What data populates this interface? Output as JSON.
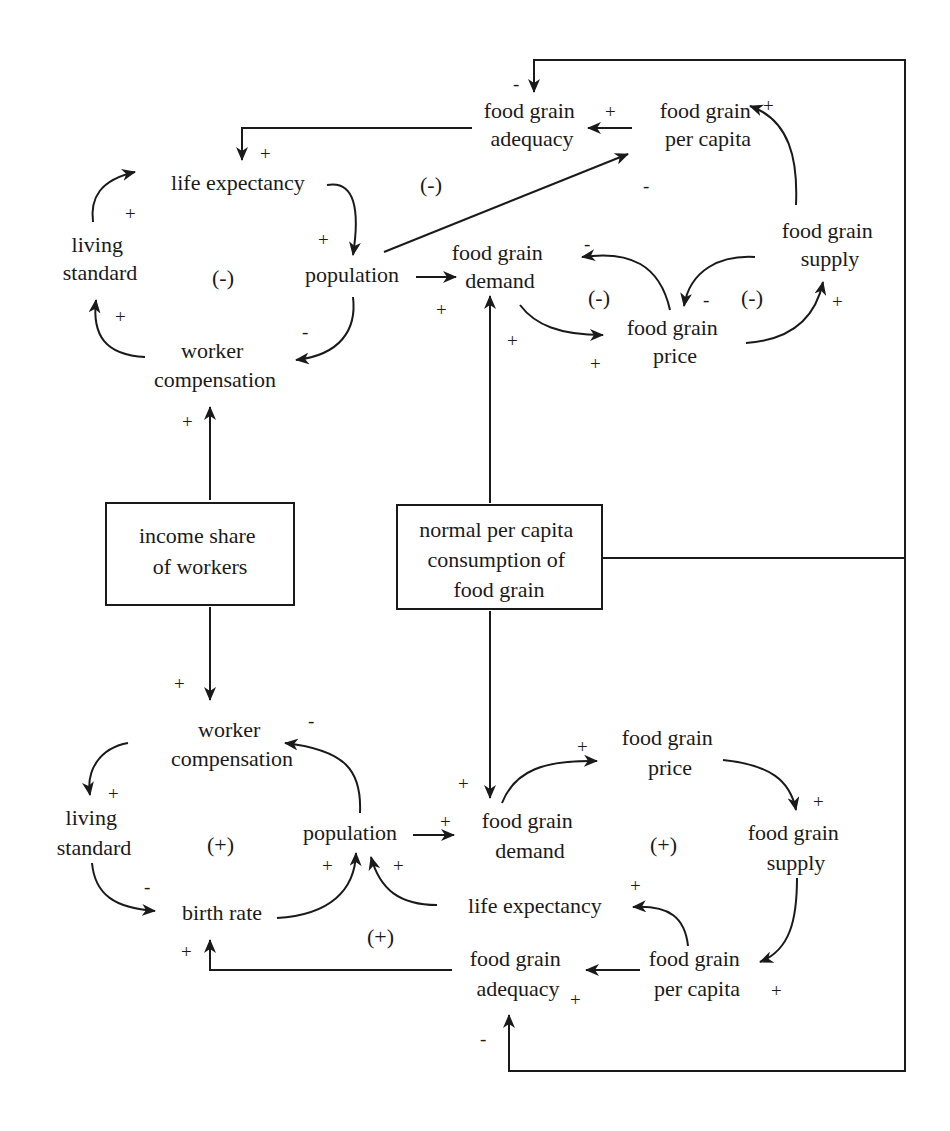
{
  "diagram": {
    "type": "causal-loop-diagram",
    "colors": {
      "ink": "#1a1a1a",
      "background": "#ffffff"
    },
    "boxes": {
      "income_share": {
        "lines": [
          "income share",
          "of workers"
        ]
      },
      "normal_consumption": {
        "lines": [
          "normal per capita",
          "consumption of",
          "food grain"
        ]
      }
    },
    "top": {
      "nodes": {
        "adequacy": [
          "food grain",
          "adequacy"
        ],
        "per_capita": [
          "food grain",
          "per capita"
        ],
        "life_expectancy": [
          "life expectancy"
        ],
        "living_standard": [
          "living",
          "standard"
        ],
        "population": [
          "population"
        ],
        "demand": [
          "food grain",
          "demand"
        ],
        "supply": [
          "food grain",
          "supply"
        ],
        "price": [
          "food grain",
          "price"
        ],
        "worker_comp": [
          "worker",
          "compensation"
        ]
      },
      "signs": [
        "-",
        "+",
        "+",
        "+",
        "+",
        "+",
        "-",
        "+",
        "+",
        "-",
        "+",
        "+",
        "-",
        "+",
        "+",
        "-",
        "+"
      ],
      "loops": [
        "(-)",
        "(-)",
        "(-)",
        "(-)"
      ]
    },
    "bottom": {
      "nodes": {
        "worker_comp": [
          "worker",
          "compensation"
        ],
        "living_standard": [
          "living",
          "standard"
        ],
        "population": [
          "population"
        ],
        "birth_rate": [
          "birth rate"
        ],
        "demand": [
          "food grain",
          "demand"
        ],
        "price": [
          "food grain",
          "price"
        ],
        "supply": [
          "food grain",
          "supply"
        ],
        "life_expectancy": [
          "life expectancy"
        ],
        "adequacy": [
          "food grain",
          "adequacy"
        ],
        "per_capita": [
          "food grain",
          "per capita"
        ]
      },
      "signs": [
        "+",
        "-",
        "+",
        "-",
        "+",
        "+",
        "+",
        "+",
        "+",
        "+",
        "+",
        "+",
        "+",
        "+",
        "+",
        "-"
      ],
      "loops": [
        "(+)",
        "(+)",
        "(+)"
      ]
    },
    "links": [
      {
        "from": "per capita (top)",
        "to": "adequacy (top)",
        "polarity": "+"
      },
      {
        "from": "supply (top)",
        "to": "per capita (top)",
        "polarity": "+"
      },
      {
        "from": "population (top)",
        "to": "per capita (top)",
        "polarity": "-"
      },
      {
        "from": "normal consumption",
        "to": "adequacy (top)",
        "polarity": "-"
      },
      {
        "from": "adequacy (top)",
        "to": "life expectancy (top)",
        "polarity": "+"
      },
      {
        "from": "living standard (top)",
        "to": "life expectancy (top)",
        "polarity": "+"
      },
      {
        "from": "life expectancy (top)",
        "to": "population (top)",
        "polarity": "+"
      },
      {
        "from": "population (top)",
        "to": "worker compensation (top)",
        "polarity": "-"
      },
      {
        "from": "worker compensation (top)",
        "to": "living standard (top)",
        "polarity": "+"
      },
      {
        "from": "income share",
        "to": "worker compensation (top)",
        "polarity": "+"
      },
      {
        "from": "population (top)",
        "to": "demand (top)",
        "polarity": "+"
      },
      {
        "from": "normal consumption",
        "to": "demand (top)",
        "polarity": "+"
      },
      {
        "from": "demand (top)",
        "to": "price (top)",
        "polarity": "+"
      },
      {
        "from": "price (top)",
        "to": "demand (top)",
        "polarity": "-"
      },
      {
        "from": "supply (top)",
        "to": "price (top)",
        "polarity": "-"
      },
      {
        "from": "price (top)",
        "to": "supply (top)",
        "polarity": "+"
      },
      {
        "from": "income share",
        "to": "worker compensation (bottom)",
        "polarity": "+"
      },
      {
        "from": "worker compensation (bottom)",
        "to": "living standard (bottom)",
        "polarity": "+"
      },
      {
        "from": "population (bottom)",
        "to": "worker compensation (bottom)",
        "polarity": "-"
      },
      {
        "from": "living standard (bottom)",
        "to": "birth rate",
        "polarity": "-"
      },
      {
        "from": "birth rate",
        "to": "population (bottom)",
        "polarity": "+"
      },
      {
        "from": "life expectancy (bottom)",
        "to": "population (bottom)",
        "polarity": "+"
      },
      {
        "from": "population (bottom)",
        "to": "demand (bottom)",
        "polarity": "+"
      },
      {
        "from": "normal consumption",
        "to": "demand (bottom)",
        "polarity": "+"
      },
      {
        "from": "demand (bottom)",
        "to": "price (bottom)",
        "polarity": "+"
      },
      {
        "from": "price (bottom)",
        "to": "supply (bottom)",
        "polarity": "+"
      },
      {
        "from": "supply (bottom)",
        "to": "per capita (bottom)",
        "polarity": "+"
      },
      {
        "from": "per capita (bottom)",
        "to": "life expectancy (bottom)",
        "polarity": "+"
      },
      {
        "from": "per capita (bottom)",
        "to": "adequacy (bottom)",
        "polarity": "+"
      },
      {
        "from": "adequacy (bottom)",
        "to": "birth rate",
        "polarity": "+"
      },
      {
        "from": "normal consumption",
        "to": "adequacy (bottom)",
        "polarity": "-"
      }
    ]
  }
}
